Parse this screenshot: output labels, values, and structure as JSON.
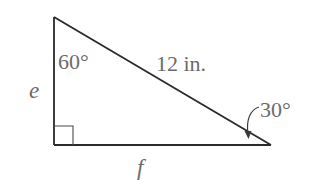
{
  "diagram": {
    "type": "right-triangle",
    "colors": {
      "lines": "#2a2a2a",
      "labels": "#6b6b6b",
      "background": "#ffffff"
    },
    "vertices": {
      "top": {
        "x": 54,
        "y": 17
      },
      "right_angle": {
        "x": 54,
        "y": 145
      },
      "right": {
        "x": 271,
        "y": 145
      }
    },
    "right_angle_marker": {
      "size": 19
    },
    "labels": {
      "angle_top": "60°",
      "hypotenuse": "12 in.",
      "angle_right": "30°",
      "side_vertical": "e",
      "side_horizontal": "f"
    }
  }
}
